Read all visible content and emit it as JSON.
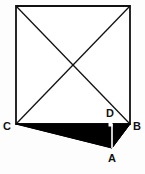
{
  "figure": {
    "type": "geometry-diagram",
    "canvas": {
      "width": 145,
      "height": 174
    },
    "background_color": "#fdfdfd",
    "stroke_color": "#111111",
    "shade_color": "#000000",
    "stroke_width": 1.6,
    "square": {
      "name": "square",
      "corners": [
        {
          "name": "top-left",
          "x": 16,
          "y": 6
        },
        {
          "name": "top-right",
          "x": 130,
          "y": 6
        },
        {
          "name": "bottom-right",
          "x": 130,
          "y": 124
        },
        {
          "name": "bottom-left",
          "x": 16,
          "y": 124
        }
      ]
    },
    "diagonals": [
      {
        "name": "diagonal-tl-br",
        "x1": 16,
        "y1": 6,
        "x2": 130,
        "y2": 124
      },
      {
        "name": "diagonal-tr-bl",
        "x1": 130,
        "y1": 6,
        "x2": 16,
        "y2": 124
      }
    ],
    "shaded_triangle": {
      "name": "triangle-CBA",
      "points": "16,124 130,124 112,148",
      "fill": "#000000"
    },
    "segment_DA": {
      "name": "segment-D-A",
      "x1": 112,
      "y1": 124,
      "x2": 112,
      "y2": 148
    },
    "points": [
      {
        "id": "C",
        "label": "C",
        "x": 16,
        "y": 124,
        "label_x": 7,
        "label_y": 127
      },
      {
        "id": "D",
        "label": "D",
        "x": 112,
        "y": 124,
        "label_x": 110,
        "label_y": 114
      },
      {
        "id": "B",
        "label": "B",
        "x": 130,
        "y": 124,
        "label_x": 134,
        "label_y": 127
      },
      {
        "id": "A",
        "label": "A",
        "x": 112,
        "y": 148,
        "label_x": 110,
        "label_y": 159
      }
    ]
  }
}
